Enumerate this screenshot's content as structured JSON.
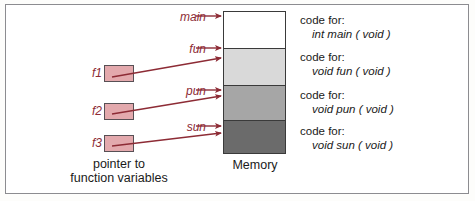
{
  "memory": {
    "caption": "Memory",
    "blocks": [
      {
        "name": "main",
        "fill": "#ffffff"
      },
      {
        "name": "fun",
        "fill": "#d9d9d9"
      },
      {
        "name": "pun",
        "fill": "#a6a6a6"
      },
      {
        "name": "sun",
        "fill": "#6b6b6b"
      }
    ]
  },
  "pointers": {
    "caption_line1": "pointer to",
    "caption_line2": "function variables",
    "boxes": [
      {
        "label": "f1"
      },
      {
        "label": "f2"
      },
      {
        "label": "f3"
      }
    ]
  },
  "function_labels": {
    "main": "main",
    "fun": "fun",
    "pun": "pun",
    "sun": "sun"
  },
  "code_entries": [
    {
      "heading": "code for:",
      "signature": "int  main  ( void )"
    },
    {
      "heading": "code for:",
      "signature": "void  fun  ( void )"
    },
    {
      "heading": "code for:",
      "signature": "void  pun  ( void )"
    },
    {
      "heading": "code for:",
      "signature": "void  sun  ( void )"
    }
  ],
  "colors": {
    "arrow": "#8d2b35",
    "label_text": "#8d2b35",
    "box_fill": "#e3a9ad",
    "box_border": "#585055",
    "frame_border": "#8c8c90",
    "block_border": "#3a3a3a"
  }
}
